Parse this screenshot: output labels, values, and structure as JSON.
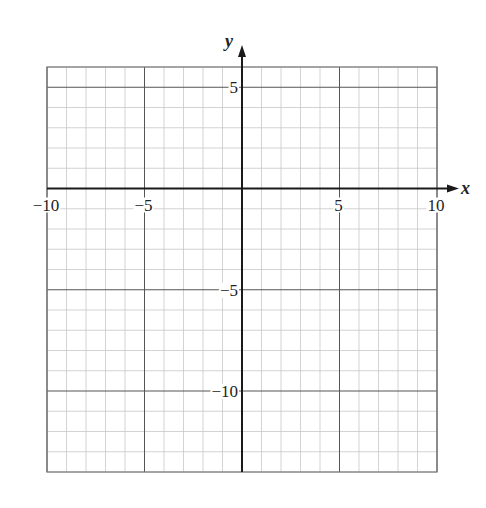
{
  "figure": {
    "type": "blank coordinate grid",
    "x_axis": {
      "label": "x",
      "min": -10,
      "max": 10,
      "ticks": [
        {
          "value": -10,
          "label": "−10"
        },
        {
          "value": -5,
          "label": "−5"
        },
        {
          "value": 5,
          "label": "5"
        },
        {
          "value": 10,
          "label": "10"
        }
      ]
    },
    "y_axis": {
      "label": "y",
      "min": -14,
      "max": 6,
      "ticks": [
        {
          "value": 5,
          "label": "5"
        },
        {
          "value": -5,
          "label": "−5"
        },
        {
          "value": -10,
          "label": "−10"
        }
      ]
    },
    "grid": {
      "minor_step": 1,
      "major_step": 5
    },
    "colors": {
      "minor_grid": "#c8c8c8",
      "major_grid": "#555555",
      "axis": "#1a1a1a",
      "border": "#777777"
    }
  }
}
